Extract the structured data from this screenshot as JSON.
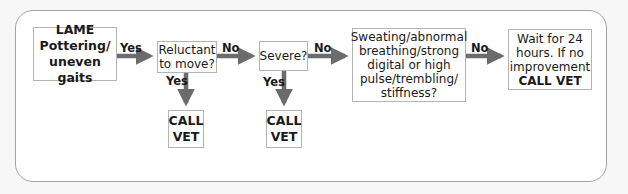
{
  "diagram": {
    "type": "flowchart",
    "colors": {
      "arrow": "#6b6b6b",
      "box_border": "#b4b4b4",
      "panel_border": "#a3a3a3",
      "text": "#1a1a1a"
    },
    "nodes": {
      "start": {
        "line1": "LAME",
        "line2": "Pottering/",
        "line3": "uneven gaits"
      },
      "reluctant": {
        "line1": "Reluctant",
        "line2": "to move?"
      },
      "severe": {
        "line1": "Severe?"
      },
      "symptoms": {
        "line1": "Sweating/abnormal",
        "line2": "breathing/strong",
        "line3": "digital or high",
        "line4": "pulse/trembling/",
        "line5": "stiffness?"
      },
      "wait": {
        "line1": "Wait for 24",
        "line2": "hours. If no",
        "line3": "improvement",
        "line4": "CALL VET"
      },
      "call_vet_1": {
        "line1": "CALL",
        "line2": "VET"
      },
      "call_vet_2": {
        "line1": "CALL",
        "line2": "VET"
      }
    },
    "edges": [
      {
        "from": "start",
        "to": "reluctant",
        "label": "Yes"
      },
      {
        "from": "reluctant",
        "to": "severe",
        "label": "No"
      },
      {
        "from": "reluctant",
        "to": "call_vet_1",
        "label": "Yes"
      },
      {
        "from": "severe",
        "to": "symptoms",
        "label": "No"
      },
      {
        "from": "severe",
        "to": "call_vet_2",
        "label": "Yes"
      },
      {
        "from": "symptoms",
        "to": "wait",
        "label": "No"
      }
    ]
  }
}
